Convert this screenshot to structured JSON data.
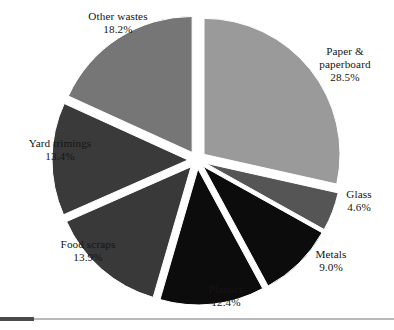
{
  "chart_data": {
    "type": "pie",
    "title": "",
    "subtitle": "",
    "xlabel": "",
    "ylabel": "",
    "legend": "none",
    "grid": false,
    "exploded": true,
    "start_angle_deg": 0,
    "direction": "clockwise",
    "total": 100.0,
    "units": "percent",
    "categories": [
      "Paper & paperboard",
      "Glass",
      "Metals",
      "Plastics",
      "Food scraps",
      "Yard trimings",
      "Other wastes"
    ],
    "values": [
      28.5,
      4.6,
      9.0,
      12.4,
      13.9,
      13.4,
      18.2
    ],
    "colors": [
      "#9a9a9a",
      "#555555",
      "#0c0c0c",
      "#0c0c0c",
      "#393939",
      "#3a3a3a",
      "#767676"
    ],
    "slices": [
      {
        "name": "Paper & paperboard",
        "value": 28.5,
        "value_label": "28.5%",
        "label_line1": "Paper &",
        "label_line2": "paperboard",
        "color": "#9a9a9a"
      },
      {
        "name": "Glass",
        "value": 4.6,
        "value_label": "4.6%",
        "label_line1": "Glass",
        "label_line2": "",
        "color": "#555555"
      },
      {
        "name": "Metals",
        "value": 9.0,
        "value_label": "9.0%",
        "label_line1": "Metals",
        "label_line2": "",
        "color": "#0c0c0c"
      },
      {
        "name": "Plastics",
        "value": 12.4,
        "value_label": "12.4%",
        "label_line1": "Plastics",
        "label_line2": "",
        "color": "#0c0c0c"
      },
      {
        "name": "Food scraps",
        "value": 13.9,
        "value_label": "13.9%",
        "label_line1": "Food scraps",
        "label_line2": "",
        "color": "#393939"
      },
      {
        "name": "Yard trimings",
        "value": 13.4,
        "value_label": "13.4%",
        "label_line1": "Yard trimings",
        "label_line2": "",
        "color": "#3a3a3a"
      },
      {
        "name": "Other wastes",
        "value": 18.2,
        "value_label": "18.2%",
        "label_line1": "Other wastes",
        "label_line2": "",
        "color": "#767676"
      }
    ]
  }
}
